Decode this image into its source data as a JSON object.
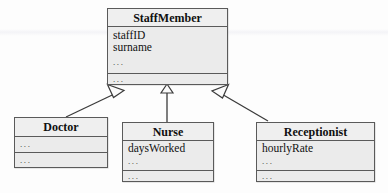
{
  "diagram": {
    "type": "uml-class-diagram",
    "background_color": "#fdfdfd",
    "box_fill_color": "#ebebeb",
    "border_color": "#5a5a5a",
    "text_color": "#111111",
    "ellipsis_text": "..."
  },
  "classes": {
    "staff_member": {
      "name": "StaffMember",
      "attributes": [
        "staffID",
        "surname"
      ],
      "attributes_ellipsis": "...",
      "operations_ellipsis": "..."
    },
    "doctor": {
      "name": "Doctor",
      "attributes_ellipsis": "...",
      "operations_ellipsis": "..."
    },
    "nurse": {
      "name": "Nurse",
      "attributes": [
        "daysWorked"
      ],
      "attributes_ellipsis": "...",
      "operations_ellipsis": "..."
    },
    "receptionist": {
      "name": "Receptionist",
      "attributes": [
        "hourlyRate"
      ],
      "attributes_ellipsis": "...",
      "operations_ellipsis": "..."
    }
  },
  "relationships": [
    {
      "name": "doctor-generalization",
      "kind": "generalization",
      "from": "Doctor",
      "to": "StaffMember"
    },
    {
      "name": "nurse-generalization",
      "kind": "generalization",
      "from": "Nurse",
      "to": "StaffMember"
    },
    {
      "name": "receptionist-generalization",
      "kind": "generalization",
      "from": "Receptionist",
      "to": "StaffMember"
    }
  ]
}
